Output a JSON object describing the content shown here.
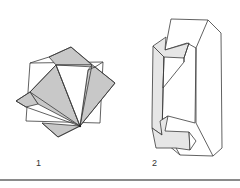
{
  "figures": [
    {
      "id": "fig1",
      "label": "1",
      "description": "interpenetrating cubes (twinned crystal)"
    },
    {
      "id": "fig2",
      "label": "2",
      "description": "prismatic crystal with re-entrant twin notches"
    }
  ],
  "colors": {
    "line": "#3a3a3a",
    "shade_dark": "#c8c8c8",
    "shade_light": "#e6e6e6",
    "rule": "#8a8a8a",
    "background": "#ffffff"
  }
}
